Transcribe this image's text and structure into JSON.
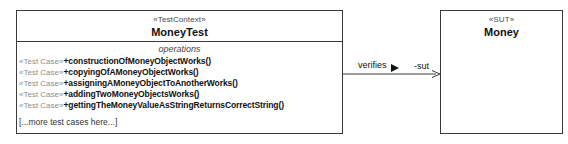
{
  "diagram": {
    "type": "uml-class-diagram",
    "test_context": {
      "stereotype": "«TestContext»",
      "name": "MoneyTest",
      "compartment_title": "operations",
      "operations": [
        {
          "stereotype": "«Test Case»",
          "signature": "+constructionOfMoneyObjectWorks()"
        },
        {
          "stereotype": "«Test Case»",
          "signature": "+copyingOfAMoneyObjectWorks()"
        },
        {
          "stereotype": "«Test Case»",
          "signature": "+assigningAMoneyObjectToAnotherWorks()"
        },
        {
          "stereotype": "«Test Case»",
          "signature": "+addingTwoMoneyObjectsWorks()"
        },
        {
          "stereotype": "«Test Case»",
          "signature": "+gettingTheMoneyValueAsStringReturnsCorrectString()"
        }
      ],
      "note": "[...more test cases here...]"
    },
    "sut": {
      "stereotype": "«SUT»",
      "name": "Money"
    },
    "association": {
      "label": "verifies",
      "direction_marker": "solid-right-triangle",
      "role_name": "-sut",
      "arrowhead": "open-arrow"
    },
    "colors": {
      "border": "#3a3a3a",
      "text": "#111111",
      "stereotype_text": "#4a4a4a",
      "op_stereotype_text": "#8d8d8d",
      "background": "#ffffff"
    }
  }
}
